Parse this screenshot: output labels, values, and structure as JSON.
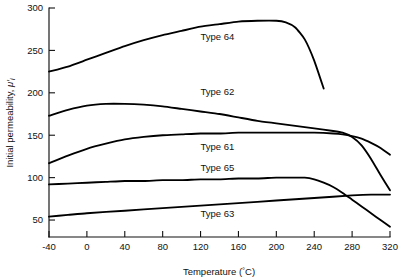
{
  "chart_data": {
    "type": "line",
    "title": "",
    "xlabel": "Temperature (°C)",
    "ylabel": "Initial permeability, μ′i",
    "xlim": [
      -40,
      320
    ],
    "ylim": [
      30,
      300
    ],
    "grid": false,
    "legend_position": "inline-labels",
    "xticks": [
      -40,
      0,
      40,
      80,
      120,
      160,
      200,
      240,
      280,
      320
    ],
    "xtick_labels": [
      "-40",
      "0",
      "40",
      "80",
      "120",
      "160",
      "200",
      "240",
      "280",
      "320"
    ],
    "yticks": [
      50,
      100,
      150,
      200,
      250,
      300
    ],
    "ytick_labels": [
      "50",
      "100",
      "150",
      "200",
      "250",
      "300"
    ],
    "series": [
      {
        "name": "Type 64",
        "label": "Type 64",
        "label_x": 120,
        "label_y": 266,
        "x": [
          -40,
          -20,
          0,
          20,
          40,
          60,
          80,
          100,
          120,
          140,
          160,
          180,
          200,
          210,
          220,
          230,
          240,
          250
        ],
        "values": [
          225,
          231,
          239,
          247,
          255,
          262,
          268,
          273,
          278,
          281,
          284,
          285,
          285,
          283,
          277,
          263,
          238,
          205
        ]
      },
      {
        "name": "Type 62",
        "label": "Type 62",
        "label_x": 120,
        "label_y": 202,
        "x": [
          -40,
          -20,
          0,
          20,
          40,
          60,
          80,
          100,
          120,
          140,
          160,
          180,
          200,
          220,
          240,
          260,
          270,
          280,
          290,
          300,
          310,
          320
        ],
        "values": [
          173,
          180,
          185,
          187,
          187,
          186,
          184,
          181,
          178,
          175,
          171,
          167,
          164,
          161,
          158,
          155,
          153,
          148,
          138,
          122,
          103,
          85
        ]
      },
      {
        "name": "Type 61",
        "label": "Type 61",
        "label_x": 120,
        "label_y": 137,
        "x": [
          -40,
          -20,
          0,
          20,
          40,
          60,
          80,
          100,
          120,
          140,
          160,
          180,
          200,
          220,
          240,
          260,
          270,
          280,
          290,
          300,
          310,
          320
        ],
        "values": [
          117,
          126,
          134,
          140,
          145,
          148,
          150,
          151,
          152,
          152,
          153,
          153,
          153,
          153,
          153,
          152,
          151,
          149,
          146,
          141,
          135,
          127
        ]
      },
      {
        "name": "Type 65",
        "label": "Type 65",
        "label_x": 120,
        "label_y": 112,
        "x": [
          -40,
          -20,
          0,
          20,
          40,
          60,
          80,
          100,
          120,
          140,
          160,
          180,
          200,
          215,
          230,
          240,
          250,
          260,
          270,
          280,
          290,
          300,
          310,
          320
        ],
        "values": [
          92,
          93,
          94,
          95,
          96,
          96,
          97,
          97,
          98,
          98,
          99,
          99,
          100,
          100,
          100,
          98,
          94,
          89,
          82,
          74,
          66,
          58,
          50,
          42
        ]
      },
      {
        "name": "Type 63",
        "label": "Type 63",
        "label_x": 120,
        "label_y": 58,
        "x": [
          -40,
          -20,
          0,
          40,
          80,
          120,
          160,
          200,
          240,
          280,
          300,
          320
        ],
        "values": [
          54,
          56,
          58,
          61,
          64,
          67,
          70,
          73,
          76,
          79,
          80,
          80
        ]
      }
    ]
  }
}
